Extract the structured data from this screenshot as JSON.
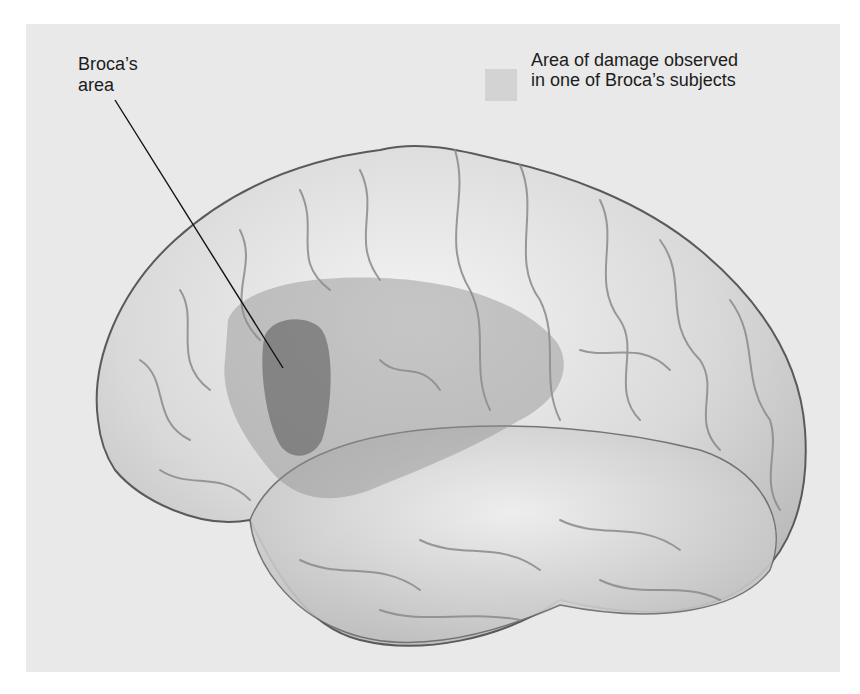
{
  "figure": {
    "labels": {
      "broca_area": {
        "line1": "Broca’s",
        "line2": "area"
      }
    },
    "legend": {
      "swatch_color": "#d3d3d3",
      "line1": "Area of damage observed",
      "line2": "in one of Broca’s subjects"
    },
    "colors": {
      "background": "#e9e9e9",
      "brain_fill": "#dcdcdc",
      "brain_outline": "#5a5a5a",
      "damage_region": "#9a9a9a",
      "broca_region": "#6e6e6e",
      "leader_line": "#111111"
    }
  }
}
